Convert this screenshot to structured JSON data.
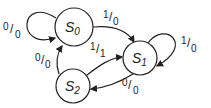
{
  "diagram": {
    "type": "state-machine",
    "states": [
      {
        "id": "S0",
        "letter": "S",
        "sub": "0"
      },
      {
        "id": "S1",
        "letter": "S",
        "sub": "1"
      },
      {
        "id": "S2",
        "letter": "S",
        "sub": "2"
      }
    ],
    "transitions": [
      {
        "from": "S0",
        "to": "S0",
        "in": "0",
        "out": "0"
      },
      {
        "from": "S0",
        "to": "S1",
        "in": "1",
        "out": "0"
      },
      {
        "from": "S1",
        "to": "S1",
        "in": "1",
        "out": "0"
      },
      {
        "from": "S1",
        "to": "S2",
        "in": "0",
        "out": "0"
      },
      {
        "from": "S2",
        "to": "S1",
        "in": "1",
        "out": "1"
      },
      {
        "from": "S2",
        "to": "S0",
        "in": "0",
        "out": "0"
      }
    ],
    "colors": {
      "stroke": "#222222",
      "background": "#ffffff"
    }
  }
}
